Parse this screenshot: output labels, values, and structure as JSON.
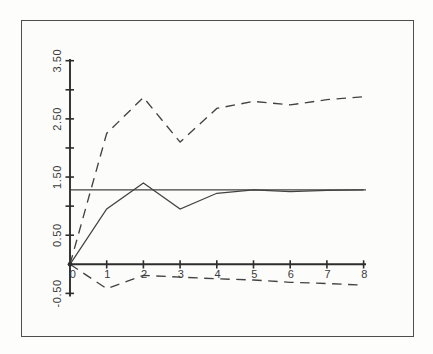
{
  "figure": {
    "background_color": "#fdfdfb",
    "frame_border_color": "#4e4e4e",
    "axis_color": "#2d2d2d",
    "line_color": "#424242",
    "label_color": "#3a3a3a"
  },
  "chart_data": {
    "type": "line",
    "title": "",
    "xlabel": "",
    "ylabel": "",
    "x": [
      0,
      1,
      2,
      3,
      4,
      5,
      6,
      7,
      8
    ],
    "series": [
      {
        "name": "upper-dashed-band",
        "style": "dashed",
        "values": [
          0,
          2.25,
          2.87,
          2.1,
          2.68,
          2.8,
          2.74,
          2.83,
          2.88
        ]
      },
      {
        "name": "solid-response",
        "style": "solid",
        "values": [
          0,
          0.95,
          1.4,
          0.95,
          1.22,
          1.28,
          1.25,
          1.27,
          1.28
        ]
      },
      {
        "name": "lower-dashed-band",
        "style": "dashed",
        "values": [
          0,
          -0.42,
          -0.19,
          -0.22,
          -0.25,
          -0.27,
          -0.31,
          -0.33,
          -0.36
        ]
      }
    ],
    "reference_line": {
      "value": 1.28,
      "style": "solid"
    },
    "x_tick_labels": [
      "0",
      "1",
      "2",
      "3",
      "4",
      "5",
      "6",
      "7",
      "8"
    ],
    "y_tick_values": [
      3.5,
      3.0,
      2.5,
      2.0,
      1.5,
      1.0,
      0.5,
      -0.5
    ],
    "y_labeled_ticks": [
      {
        "value": 3.5,
        "label": "3.50"
      },
      {
        "value": 2.5,
        "label": "2.50"
      },
      {
        "value": 1.5,
        "label": "1.50"
      },
      {
        "value": 0.5,
        "label": "0.50"
      },
      {
        "value": -0.5,
        "label": "-0.50"
      }
    ],
    "xlim": [
      0,
      8.1
    ],
    "ylim": [
      -0.6,
      3.6
    ],
    "grid": false,
    "legend": null
  }
}
